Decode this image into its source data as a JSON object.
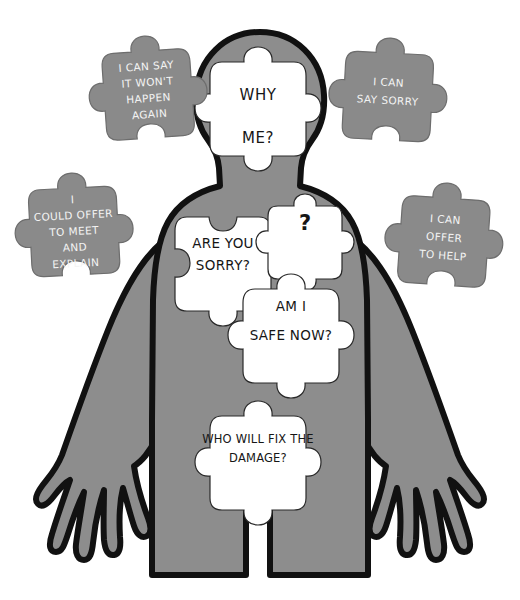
{
  "figure": {
    "name": "human-body-silhouette",
    "body_color": "#8d8d8d",
    "outline_color": "#111111",
    "hole_color": "#ffffff"
  },
  "colors": {
    "background": "#ffffff",
    "body_gray": "#8d8d8d",
    "loose_piece_gray": "#8a8a8a",
    "outline": "#111111",
    "dark_text": "#161616",
    "light_text": "#f4f4f4"
  },
  "inner_pieces": [
    {
      "id": "head-piece",
      "lines": [
        "WHY",
        "ME?"
      ],
      "text_color": "#161616",
      "fill": "#ffffff"
    },
    {
      "id": "chest-left",
      "lines": [
        "ARE YOU",
        "SORRY?"
      ],
      "text_color": "#161616",
      "fill": "#ffffff"
    },
    {
      "id": "chest-question",
      "lines": [
        "?"
      ],
      "text_color": "#161616",
      "fill": "#ffffff"
    },
    {
      "id": "chest-right",
      "lines": [
        "AM I",
        "SAFE NOW?"
      ],
      "text_color": "#161616",
      "fill": "#ffffff"
    },
    {
      "id": "abdomen-piece",
      "lines": [
        "WHO WILL FIX THE",
        "DAMAGE?"
      ],
      "text_color": "#161616",
      "fill": "#ffffff"
    }
  ],
  "outer_pieces": [
    {
      "id": "top-left",
      "lines": [
        "I CAN SAY",
        "IT WON'T",
        "HAPPEN",
        "AGAIN"
      ],
      "text_color": "#f4f4f4",
      "fill": "#8a8a8a"
    },
    {
      "id": "top-right",
      "lines": [
        "I CAN",
        "SAY SORRY"
      ],
      "text_color": "#f4f4f4",
      "fill": "#8a8a8a"
    },
    {
      "id": "mid-left",
      "lines": [
        "I",
        "COULD OFFER",
        "TO MEET",
        "AND",
        "EXPLAIN"
      ],
      "text_color": "#f4f4f4",
      "fill": "#8a8a8a"
    },
    {
      "id": "mid-right",
      "lines": [
        "I CAN",
        "OFFER",
        "TO HELP"
      ],
      "text_color": "#f4f4f4",
      "fill": "#8a8a8a"
    }
  ]
}
